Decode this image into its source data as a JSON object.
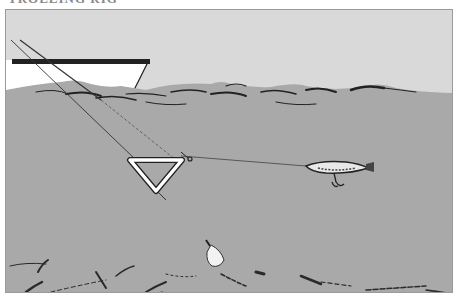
{
  "caption": {
    "text": "TROLLING RIG"
  },
  "illustration": {
    "colors": {
      "sky": "#d9d9d9",
      "water": "#a9a9a9",
      "boat_hull": "#ffffff",
      "ink": "#1e1e1e",
      "frame": "#9a9a9a"
    },
    "elements": [
      "boat",
      "surface-waves",
      "fishing-line",
      "triangle-diver",
      "swivel",
      "lure",
      "treble-hook",
      "sinker",
      "bottom-contours"
    ]
  }
}
